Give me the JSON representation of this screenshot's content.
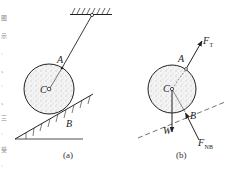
{
  "figure_a": {
    "caption": "(a)",
    "labels": {
      "A": "A",
      "B": "B",
      "C": "C"
    },
    "parts": [
      "ceiling-support",
      "rope",
      "sphere",
      "inclined-plane"
    ]
  },
  "figure_b": {
    "caption": "(b)",
    "labels": {
      "A": "A",
      "B": "B",
      "C": "C"
    },
    "forces": {
      "tension": {
        "main": "F",
        "sub": "T"
      },
      "weight": {
        "main": "W"
      },
      "normal": {
        "main": "F",
        "sub": "NB"
      }
    }
  },
  "side_text": [
    "图",
    "示",
    "·",
    "、",
    "·",
    "、",
    "三",
    "·",
    "受",
    "·"
  ],
  "colors": {
    "ink": "#222222",
    "fill": "#f2f2f2",
    "dots": "#8a8a8a"
  }
}
